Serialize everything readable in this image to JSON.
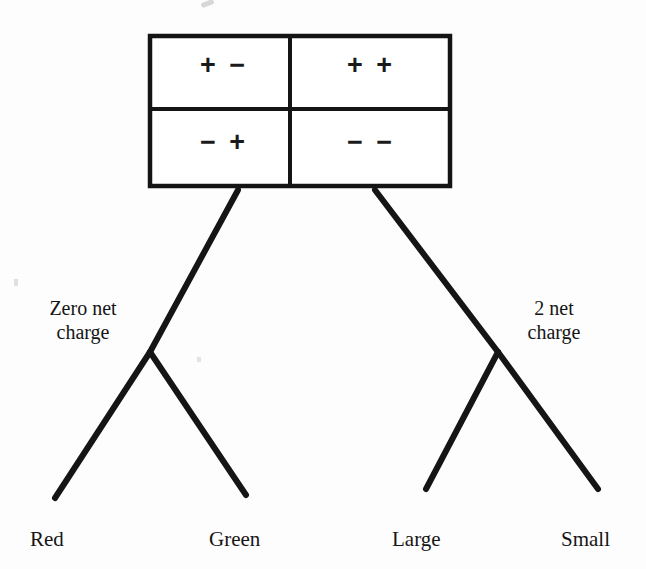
{
  "diagram": {
    "background_color": "#fdfdfd",
    "ink_color": "#151515",
    "matrix": {
      "name": "charge-pair-matrix",
      "rows": 2,
      "cols": 2,
      "border_width_px": 4,
      "bounds": {
        "x": 148,
        "y": 34,
        "width": 304,
        "height": 154
      },
      "cells": [
        {
          "id": "top-left",
          "label": "+ −",
          "row": 0,
          "col": 0
        },
        {
          "id": "top-right",
          "label": "+ +",
          "row": 0,
          "col": 1
        },
        {
          "id": "bottom-left",
          "label": "− +",
          "row": 1,
          "col": 0
        },
        {
          "id": "bottom-right",
          "label": "− −",
          "row": 1,
          "col": 1
        }
      ]
    },
    "branch_notes": [
      {
        "id": "zero-net-charge",
        "label": "Zero net\ncharge"
      },
      {
        "id": "two-net-charge",
        "label": "2 net\ncharge"
      }
    ],
    "leaves": [
      {
        "id": "red",
        "label": "Red"
      },
      {
        "id": "green",
        "label": "Green"
      },
      {
        "id": "large",
        "label": "Large"
      },
      {
        "id": "small",
        "label": "Small"
      }
    ],
    "edges": [
      {
        "id": "trunk-left",
        "from": "matrix-bottom",
        "to": "node-zero",
        "x1": 238,
        "y1": 190,
        "x2": 150,
        "y2": 352
      },
      {
        "id": "trunk-right",
        "from": "matrix-bottom",
        "to": "node-two",
        "x1": 375,
        "y1": 190,
        "x2": 498,
        "y2": 352
      },
      {
        "id": "zero-to-red",
        "from": "node-zero",
        "to": "leaf-red",
        "x1": 150,
        "y1": 352,
        "x2": 55,
        "y2": 498
      },
      {
        "id": "zero-to-green",
        "from": "node-zero",
        "to": "leaf-green",
        "x1": 150,
        "y1": 352,
        "x2": 246,
        "y2": 495
      },
      {
        "id": "two-to-large",
        "from": "node-two",
        "to": "leaf-large",
        "x1": 498,
        "y1": 352,
        "x2": 426,
        "y2": 489
      },
      {
        "id": "two-to-small",
        "from": "node-two",
        "to": "leaf-small",
        "x1": 498,
        "y1": 352,
        "x2": 598,
        "y2": 489
      }
    ]
  }
}
